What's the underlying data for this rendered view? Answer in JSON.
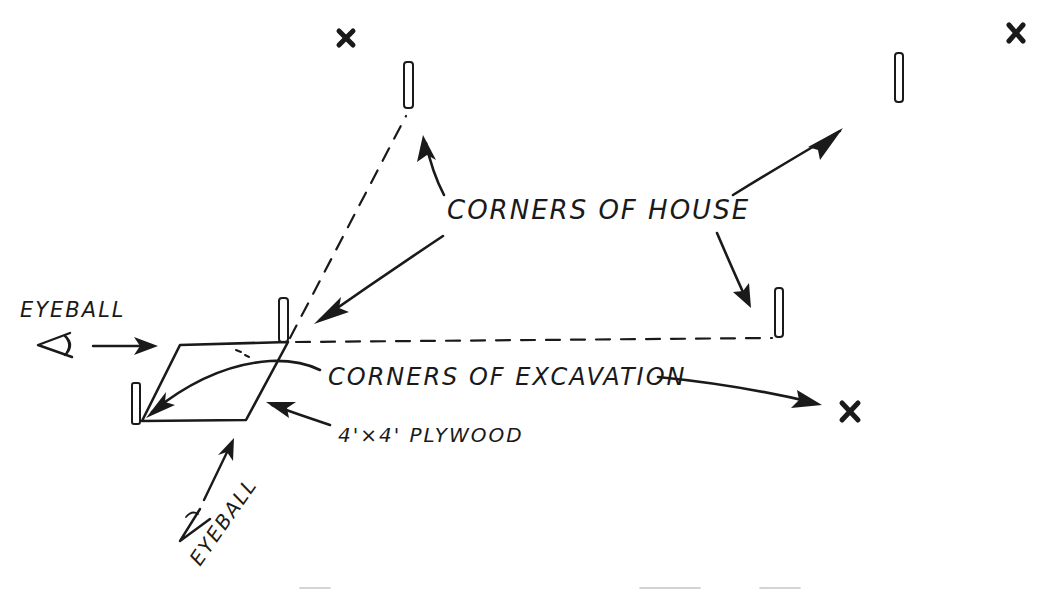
{
  "diagram": {
    "type": "hand-drawn site layout sketch",
    "background": "#ffffff",
    "ink_color": "#1a1a1a",
    "labels": {
      "corners_of_house": "CORNERS OF HOUSE",
      "corners_of_excavation": "CORNERS OF EXCAVATION",
      "plywood": "4'×4' PLYWOOD",
      "eyeball_left": "EYEBALL",
      "eyeball_bottom": "EYEBALL"
    },
    "elements": {
      "house_corner_stakes": [
        {
          "id": "stake-top-left",
          "x": 408,
          "y": 62
        },
        {
          "id": "stake-top-right",
          "x": 899,
          "y": 53
        },
        {
          "id": "stake-right",
          "x": 779,
          "y": 288
        },
        {
          "id": "stake-plywood-corner",
          "x": 283,
          "y": 298
        }
      ],
      "excavation_corner_marks": [
        {
          "id": "x-top-left",
          "x": 346,
          "y": 38,
          "symbol": "x"
        },
        {
          "id": "x-top-right",
          "x": 1016,
          "y": 33,
          "symbol": "x"
        },
        {
          "id": "x-bottom-right",
          "x": 850,
          "y": 411,
          "symbol": "x"
        },
        {
          "id": "stake-plywood-left",
          "x": 136,
          "y": 385
        }
      ],
      "sight_lines": [
        {
          "id": "sightline-diagonal",
          "from": [
            287,
            341
          ],
          "to": [
            408,
            112
          ],
          "style": "dashed"
        },
        {
          "id": "sightline-horizontal",
          "from": [
            290,
            342
          ],
          "to": [
            777,
            338
          ],
          "style": "dashed"
        }
      ],
      "plywood_board": {
        "corners": [
          [
            180,
            345
          ],
          [
            288,
            342
          ],
          [
            246,
            420
          ],
          [
            142,
            421
          ]
        ]
      }
    },
    "caption": {
      "visible": false,
      "note_text": ""
    }
  }
}
